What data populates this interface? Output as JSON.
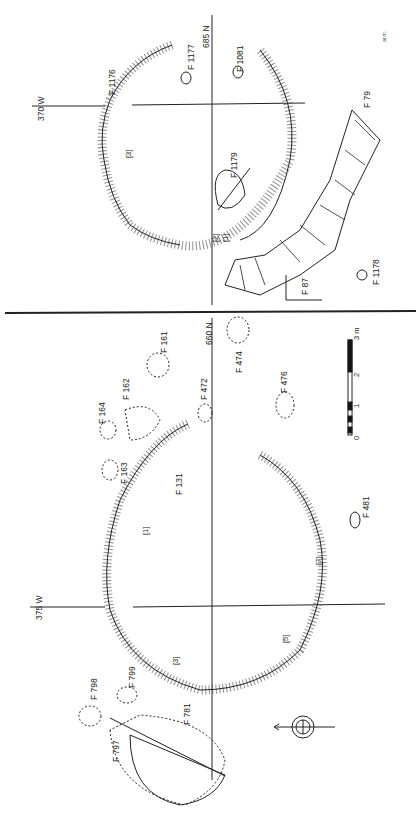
{
  "upper_panel": {
    "grid": {
      "west": "370 W",
      "north": "685 N"
    },
    "features": [
      "F 1176",
      "F 1177",
      "F 1081",
      "F 1179",
      "F 1178",
      "F 87",
      "F 79"
    ],
    "section_marks": [
      "[3]",
      "[2]",
      "[1]"
    ],
    "initials": "ar.m."
  },
  "lower_panel": {
    "grid": {
      "west": "375 W",
      "north": "660 N"
    },
    "features": [
      "F 474",
      "F 476",
      "F 472",
      "F 161",
      "F 162",
      "F 164",
      "F 163",
      "F 131",
      "F 481",
      "F 798",
      "F 799",
      "F 781",
      "F 797"
    ],
    "section_marks": [
      "[1]",
      "[3]",
      "[5]",
      "[7]"
    ],
    "scale": {
      "unit": "3 m",
      "ticks": [
        "0",
        "1",
        "2"
      ]
    }
  },
  "north_arrow": "north-arrow-icon"
}
